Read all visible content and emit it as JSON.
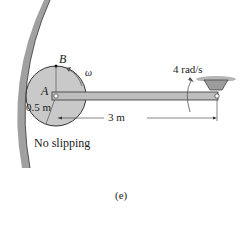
{
  "diagram": {
    "labels": {
      "point_b": "B",
      "point_a": "A",
      "omega": "ω",
      "radius": "0.5 m",
      "angular_velocity": "4 rad/s",
      "rod_length": "3 m",
      "condition": "No slipping",
      "caption": "(e)"
    },
    "colors": {
      "wall": "#9a9a9a",
      "disk": "#c8c8c8",
      "rod": "#bdbdbd",
      "outline": "#2a2a2a"
    }
  }
}
